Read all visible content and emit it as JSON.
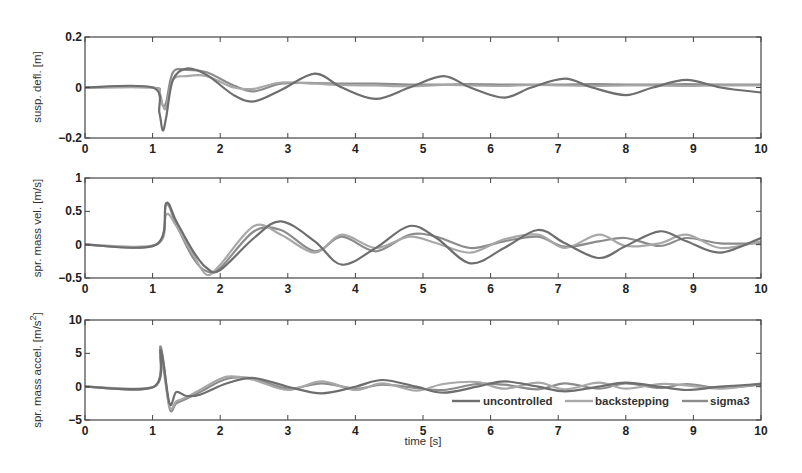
{
  "figure": {
    "xlabel": "time [s]",
    "colors": {
      "uncontrolled": "#6e6e6e",
      "backstepping": "#a8a8a8",
      "sigma3": "#8c8c8c",
      "axes": "#444444"
    },
    "legend": {
      "position": "bottom-right of bottom panel",
      "entries": [
        "uncontrolled",
        "backstepping",
        "sigma3"
      ]
    }
  },
  "chart_data": [
    {
      "type": "line",
      "title": "",
      "xlabel": "",
      "ylabel": "susp. defl. [m]",
      "xlim": [
        0,
        10
      ],
      "ylim": [
        -0.2,
        0.2
      ],
      "xticks": [
        "0",
        "1",
        "2",
        "3",
        "4",
        "5",
        "6",
        "7",
        "8",
        "9",
        "10"
      ],
      "yticks": [
        "-0.2",
        "0",
        "0.2"
      ],
      "grid": false,
      "x": [
        0,
        1.0,
        1.1,
        1.15,
        1.2,
        1.3,
        1.5,
        1.8,
        2.2,
        2.5,
        2.9,
        3.4,
        3.8,
        4.3,
        4.8,
        5.3,
        5.7,
        6.2,
        6.6,
        7.1,
        7.5,
        8.0,
        8.4,
        8.9,
        9.4,
        10
      ],
      "series": [
        {
          "name": "uncontrolled",
          "values": [
            0,
            0,
            -0.1,
            -0.17,
            -0.12,
            0.03,
            0.075,
            0.05,
            -0.03,
            -0.055,
            -0.01,
            0.055,
            0.0,
            -0.045,
            0.0,
            0.045,
            0.0,
            -0.04,
            0.0,
            0.035,
            0.0,
            -0.03,
            0.0,
            0.03,
            0.0,
            -0.02
          ]
        },
        {
          "name": "backstepping",
          "values": [
            0,
            0,
            -0.03,
            -0.07,
            -0.08,
            0.03,
            0.045,
            0.045,
            0.0,
            -0.005,
            0.02,
            0.015,
            0.01,
            0.008,
            0.005,
            0.01,
            0.008,
            0.006,
            0.01,
            0.008,
            0.006,
            0.008,
            0.008,
            0.006,
            0.008,
            0.008
          ]
        },
        {
          "name": "sigma3",
          "values": [
            0,
            0,
            -0.02,
            -0.07,
            -0.06,
            0.06,
            0.07,
            0.06,
            0.008,
            -0.015,
            0.015,
            0.018,
            0.015,
            0.015,
            0.012,
            0.012,
            0.014,
            0.012,
            0.012,
            0.012,
            0.013,
            0.012,
            0.012,
            0.013,
            0.012,
            0.012
          ]
        }
      ]
    },
    {
      "type": "line",
      "title": "",
      "xlabel": "",
      "ylabel": "spr. mass vel. [m/s]",
      "xlim": [
        0,
        10
      ],
      "ylim": [
        -0.5,
        1
      ],
      "xticks": [
        "0",
        "1",
        "2",
        "3",
        "4",
        "5",
        "6",
        "7",
        "8",
        "9",
        "10"
      ],
      "yticks": [
        "-0.5",
        "0",
        "0.5",
        "1"
      ],
      "grid": false,
      "x": [
        0,
        1.05,
        1.2,
        1.35,
        1.6,
        1.8,
        2.0,
        2.5,
        2.9,
        3.4,
        3.8,
        4.3,
        4.8,
        5.2,
        5.7,
        6.2,
        6.7,
        7.1,
        7.6,
        8.0,
        8.5,
        8.9,
        9.4,
        10
      ],
      "series": [
        {
          "name": "uncontrolled",
          "values": [
            0,
            0,
            0.62,
            0.35,
            -0.1,
            -0.35,
            -0.38,
            0.1,
            0.35,
            0.05,
            -0.3,
            -0.05,
            0.28,
            0.1,
            -0.28,
            -0.05,
            0.22,
            0.02,
            -0.2,
            -0.02,
            0.2,
            0.05,
            -0.12,
            0.1
          ]
        },
        {
          "name": "backstepping",
          "values": [
            0,
            0,
            0.45,
            0.28,
            -0.15,
            -0.45,
            -0.3,
            0.28,
            0.15,
            -0.12,
            0.15,
            -0.05,
            0.12,
            0.02,
            -0.12,
            0.08,
            0.15,
            -0.05,
            0.15,
            -0.02,
            0.02,
            0.15,
            -0.05,
            0.05
          ]
        },
        {
          "name": "sigma3",
          "values": [
            0,
            0,
            0.6,
            0.3,
            -0.2,
            -0.4,
            -0.35,
            0.2,
            0.22,
            -0.1,
            0.12,
            -0.1,
            0.15,
            0.12,
            -0.05,
            0.05,
            0.12,
            -0.03,
            0.05,
            0.1,
            -0.02,
            0.1,
            0.02,
            0.02
          ]
        }
      ]
    },
    {
      "type": "line",
      "title": "",
      "xlabel": "time [s]",
      "ylabel": "spr. mass accel. [m/s^2]",
      "xlim": [
        0,
        10
      ],
      "ylim": [
        -5,
        10
      ],
      "xticks": [
        "0",
        "1",
        "2",
        "3",
        "4",
        "5",
        "6",
        "7",
        "8",
        "9",
        "10"
      ],
      "yticks": [
        "-5",
        "0",
        "5",
        "10"
      ],
      "grid": false,
      "x": [
        0,
        1.02,
        1.12,
        1.25,
        1.35,
        1.5,
        1.7,
        2.1,
        2.5,
        3.0,
        3.5,
        4.0,
        4.4,
        4.9,
        5.3,
        5.8,
        6.2,
        6.7,
        7.1,
        7.6,
        8.0,
        8.5,
        8.9,
        9.4,
        10
      ],
      "series": [
        {
          "name": "uncontrolled",
          "values": [
            0,
            0,
            5.5,
            -2.5,
            -0.8,
            -1.4,
            -1.2,
            0.5,
            1.3,
            0.0,
            -1.0,
            0.0,
            1.0,
            0.0,
            -0.9,
            0.0,
            0.8,
            0.0,
            -0.7,
            0.0,
            0.6,
            0.0,
            -0.5,
            0.0,
            0.4
          ]
        },
        {
          "name": "backstepping",
          "values": [
            0,
            0,
            4.5,
            -3.0,
            -2.2,
            -1.6,
            -0.5,
            1.5,
            1.0,
            -0.5,
            0.8,
            -0.5,
            0.5,
            -0.6,
            0.4,
            0.7,
            -0.3,
            0.6,
            -0.4,
            0.6,
            -0.3,
            0.4,
            0.2,
            -0.3,
            0.5
          ]
        },
        {
          "name": "sigma3",
          "values": [
            0,
            0,
            6.0,
            -3.2,
            -2.5,
            -1.8,
            -0.8,
            1.2,
            1.2,
            -0.3,
            0.5,
            -0.3,
            0.3,
            -0.2,
            -0.5,
            0.4,
            0.3,
            -0.4,
            0.5,
            -0.3,
            0.5,
            -0.2,
            0.4,
            -0.2,
            0.3
          ]
        }
      ]
    }
  ]
}
